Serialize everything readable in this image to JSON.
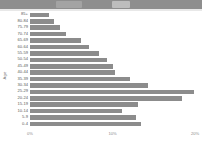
{
  "window": {
    "chrome_label": "",
    "tab_one": "",
    "tab_two": ""
  },
  "chart_data": {
    "type": "bar",
    "orientation": "horizontal",
    "title": "",
    "xlabel": "",
    "ylabel": "Age",
    "xlim": [
      0,
      20
    ],
    "xticks": [
      0,
      10,
      20
    ],
    "xticklabels": [
      "0%",
      "10%",
      "20%"
    ],
    "grid": false,
    "legend": null,
    "bar_color": "#8c8c8c",
    "categories": [
      "85+",
      "80-84",
      "75-79",
      "70-74",
      "65-69",
      "60-64",
      "55-59",
      "50-54",
      "45-49",
      "40-44",
      "35-39",
      "30-34",
      "25-29",
      "20-24",
      "15-19",
      "10-14",
      "5-9",
      "0-4"
    ],
    "values": [
      2.3,
      2.9,
      3.6,
      4.4,
      6.2,
      7.1,
      8.4,
      9.3,
      10.0,
      10.3,
      12.1,
      14.3,
      19.9,
      18.4,
      13.1,
      11.2,
      12.9,
      13.4
    ],
    "value_unit": "%"
  }
}
